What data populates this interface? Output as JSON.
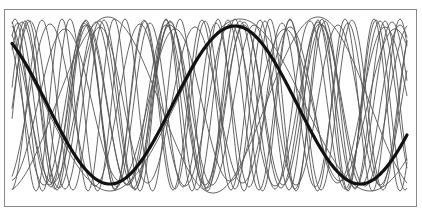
{
  "caption": "",
  "chart_data": {
    "type": "line",
    "title": "",
    "xlabel": "",
    "ylabel": "",
    "grid": false,
    "legend": null,
    "x_range_px": [
      12,
      407
    ],
    "y_center_px": 105,
    "colors": {
      "thin": "#555555",
      "bold": "#111111",
      "frame": "#8a8a8a"
    },
    "bold_series": {
      "name": "highlighted sinusoid",
      "amplitude_px": 79,
      "period_px": 250,
      "phase_x_px": 235,
      "stroke_width": 3.2
    },
    "thin_series": [
      {
        "amplitude_px": 86,
        "period_px": 260,
        "phase_x_px": -20
      },
      {
        "amplitude_px": 88,
        "period_px": 210,
        "phase_x_px": 318
      },
      {
        "amplitude_px": 85,
        "period_px": 62,
        "phase_x_px": 42
      },
      {
        "amplitude_px": 84,
        "period_px": 70,
        "phase_x_px": 30
      },
      {
        "amplitude_px": 80,
        "period_px": 78,
        "phase_x_px": 88
      },
      {
        "amplitude_px": 86,
        "period_px": 55,
        "phase_x_px": 125
      },
      {
        "amplitude_px": 78,
        "period_px": 95,
        "phase_x_px": 100
      },
      {
        "amplitude_px": 82,
        "period_px": 66,
        "phase_x_px": 150
      },
      {
        "amplitude_px": 85,
        "period_px": 58,
        "phase_x_px": 260
      },
      {
        "amplitude_px": 80,
        "period_px": 84,
        "phase_x_px": 170
      },
      {
        "amplitude_px": 83,
        "period_px": 74,
        "phase_x_px": 22
      },
      {
        "amplitude_px": 76,
        "period_px": 110,
        "phase_x_px": 65
      },
      {
        "amplitude_px": 84,
        "period_px": 60,
        "phase_x_px": 205
      },
      {
        "amplitude_px": 81,
        "period_px": 90,
        "phase_x_px": 140
      },
      {
        "amplitude_px": 86,
        "period_px": 52,
        "phase_x_px": 10
      }
    ]
  }
}
